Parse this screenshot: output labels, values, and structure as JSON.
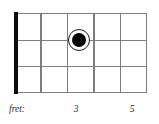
{
  "diagram": {
    "type": "fretboard-chord-diagram",
    "strings": 4,
    "frets": 5,
    "nut": {
      "present": true,
      "color": "#0d0d0d"
    },
    "grid": {
      "vertical_lines": 6,
      "horizontal_lines": 4,
      "line_color": "#7d7d7d",
      "background": "#ffffff"
    },
    "markers": [
      {
        "label": "",
        "fret_position": 3,
        "string_position": 2,
        "x_percent": 48.9,
        "y_percent": 33.3,
        "fill": "#000000",
        "ring": "#ffffff",
        "outline": "#1a1a1a"
      }
    ]
  },
  "axis": {
    "caption": "fret:",
    "ticks": [
      {
        "label": "3",
        "x": 76
      },
      {
        "label": "5",
        "x": 132
      }
    ]
  }
}
